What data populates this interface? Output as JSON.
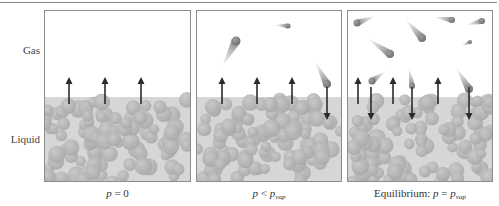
{
  "labels": {
    "gas": "Gas",
    "liquid": "Liquid"
  },
  "colors": {
    "border": "#8c8c8c",
    "liquid_bg": "#d6d6d6",
    "sphere": "#a9a9a9",
    "sphere_highlight": "#c8c8c8",
    "arrow": "#2b2b2b",
    "molecule": "#6e6e6e"
  },
  "panels": [
    {
      "id": "p-zero",
      "x": 44,
      "width": 147,
      "caption": {
        "var": "p",
        "op": " = ",
        "rhs": "0",
        "rhs_sub": ""
      },
      "up_arrows": [
        24,
        60,
        96
      ],
      "down_arrows": [],
      "molecules": []
    },
    {
      "id": "p-less",
      "x": 196,
      "width": 146,
      "caption": {
        "var": "p",
        "op": " < ",
        "rhs": "p",
        "rhs_sub": "vap"
      },
      "up_arrows": [
        25,
        60,
        95
      ],
      "down_arrows": [
        130
      ],
      "molecules": [
        {
          "x": 39,
          "y": 30,
          "tx": 25,
          "ty": 56,
          "r": 4.5
        },
        {
          "x": 91,
          "y": 15,
          "tx": 77,
          "ty": 14,
          "r": 2.5
        },
        {
          "x": 130,
          "y": 73,
          "tx": 118,
          "ty": 50,
          "r": 4
        }
      ]
    },
    {
      "id": "p-equilibrium",
      "x": 347,
      "width": 146,
      "caption": {
        "prefix": "Equilibrium: ",
        "var": "p",
        "op": " = ",
        "rhs": "p",
        "rhs_sub": "vap"
      },
      "up_arrows": [
        10,
        45,
        90
      ],
      "down_arrows": [
        23,
        64,
        121
      ],
      "molecules": [
        {
          "x": 9,
          "y": 12,
          "tx": 28,
          "ty": 5,
          "r": 3.5
        },
        {
          "x": 74,
          "y": 27,
          "tx": 57,
          "ty": 8,
          "r": 4
        },
        {
          "x": 42,
          "y": 43,
          "tx": 19,
          "ty": 27,
          "r": 4
        },
        {
          "x": 104,
          "y": 9,
          "tx": 86,
          "ty": 6,
          "r": 3
        },
        {
          "x": 134,
          "y": 10,
          "tx": 118,
          "ty": 14,
          "r": 3
        },
        {
          "x": 122,
          "y": 31,
          "tx": 113,
          "ty": 35,
          "r": 2
        },
        {
          "x": 24,
          "y": 70,
          "tx": 38,
          "ty": 60,
          "r": 3.5
        },
        {
          "x": 64,
          "y": 75,
          "tx": 61,
          "ty": 56,
          "r": 3
        },
        {
          "x": 121,
          "y": 78,
          "tx": 108,
          "ty": 56,
          "r": 4
        }
      ]
    }
  ],
  "liquid_top": 86,
  "arrow_up": {
    "from": 93,
    "to": 66
  },
  "arrow_down": {
    "from": 76,
    "to": 109
  }
}
